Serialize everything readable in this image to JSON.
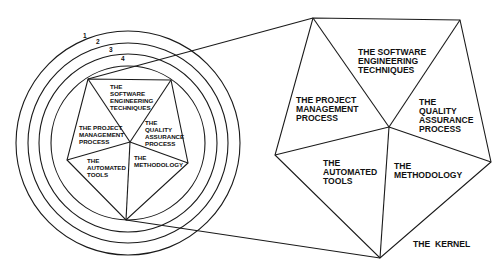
{
  "diagram": {
    "rings": [
      {
        "label": "1"
      },
      {
        "label": "2"
      },
      {
        "label": "3"
      },
      {
        "label": "4"
      }
    ],
    "segments": {
      "top": [
        "THE",
        "SOFTWARE",
        "ENGINEERING",
        "TECHNIQUES"
      ],
      "top_large": [
        "THE SOFTWARE",
        "ENGINEERING",
        "TECHNIQUES"
      ],
      "left": [
        "THE PROJECT",
        "MANAGEMENT",
        "PROCESS"
      ],
      "right": [
        "THE",
        "QUALITY",
        "ASSURANCE",
        "PROCESS"
      ],
      "bottom_left": [
        "THE",
        "AUTOMATED",
        "TOOLS"
      ],
      "bottom_right": [
        "THE",
        "METHODOLOGY"
      ]
    },
    "kernel_label": "THE  KERNEL"
  }
}
